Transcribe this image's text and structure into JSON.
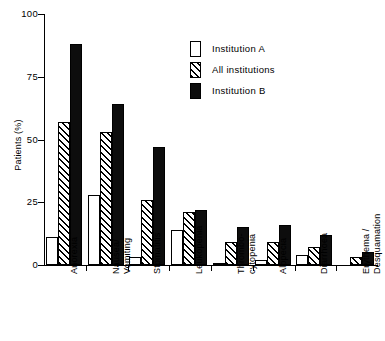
{
  "chart_data": {
    "type": "bar",
    "title": "",
    "xlabel": "",
    "ylabel": "Patients (%)",
    "ylim": [
      0,
      100
    ],
    "yticks": [
      0,
      25,
      50,
      75,
      100
    ],
    "ytick_labels": [
      "0",
      "25",
      "50",
      "75",
      "100"
    ],
    "grid": false,
    "legend_position": "top-right",
    "categories": [
      "Anorexia",
      "Nausea/\nVomiting",
      "Stomatitis",
      "Leukopenia",
      "Thrombo-\ncytopenia",
      "Alopecia",
      "Diarrhoea",
      "Erythema /\nDesquamation"
    ],
    "series": [
      {
        "name": "Institution A",
        "fill": "white",
        "values": [
          11,
          28,
          3,
          14,
          1,
          2,
          4,
          0
        ]
      },
      {
        "name": "All institutions",
        "fill": "hatched",
        "values": [
          57,
          53,
          26,
          21,
          9,
          9,
          7,
          3
        ]
      },
      {
        "name": "Institution B",
        "fill": "black",
        "values": [
          88,
          64,
          47,
          22,
          15,
          16,
          12,
          5
        ]
      }
    ]
  },
  "legend": {
    "items": [
      {
        "label": "Institution A",
        "fill": "white"
      },
      {
        "label": "All institutions",
        "fill": "hatched"
      },
      {
        "label": "Institution B",
        "fill": "black"
      }
    ]
  }
}
